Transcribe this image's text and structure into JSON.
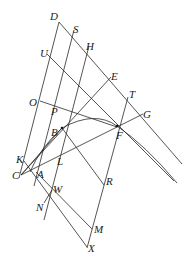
{
  "diagram": {
    "type": "geometric-construction",
    "labels": [
      {
        "id": "D",
        "text": "D",
        "x": 50,
        "y": 20
      },
      {
        "id": "S",
        "text": "S",
        "x": 73,
        "y": 33
      },
      {
        "id": "H",
        "text": "H",
        "x": 86,
        "y": 50
      },
      {
        "id": "U",
        "text": "U",
        "x": 40,
        "y": 57
      },
      {
        "id": "E",
        "text": "E",
        "x": 111,
        "y": 80
      },
      {
        "id": "T",
        "text": "T",
        "x": 129,
        "y": 98
      },
      {
        "id": "G",
        "text": "G",
        "x": 143,
        "y": 118
      },
      {
        "id": "O",
        "text": "O",
        "x": 29,
        "y": 106
      },
      {
        "id": "P",
        "text": "P",
        "x": 51,
        "y": 115
      },
      {
        "id": "B",
        "text": "B",
        "x": 51,
        "y": 136
      },
      {
        "id": "F",
        "text": "F",
        "x": 116,
        "y": 139
      },
      {
        "id": "K",
        "text": "K",
        "x": 16,
        "y": 163
      },
      {
        "id": "C",
        "text": "C",
        "x": 12,
        "y": 179
      },
      {
        "id": "A",
        "text": "A",
        "x": 37,
        "y": 178
      },
      {
        "id": "L",
        "text": "L",
        "x": 57,
        "y": 165
      },
      {
        "id": "W",
        "text": "W",
        "x": 53,
        "y": 193
      },
      {
        "id": "N",
        "text": "N",
        "x": 36,
        "y": 211
      },
      {
        "id": "R",
        "text": "R",
        "x": 106,
        "y": 185
      },
      {
        "id": "M",
        "text": "M",
        "x": 94,
        "y": 233
      },
      {
        "id": "X",
        "text": "X",
        "x": 88,
        "y": 252
      }
    ]
  }
}
